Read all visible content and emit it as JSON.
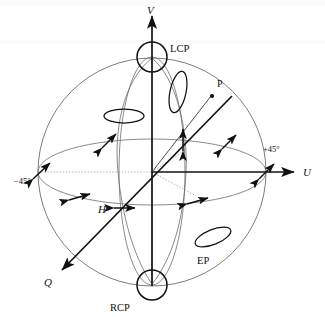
{
  "figure": {
    "name": "poincare-sphere",
    "background_color": "#ffffff",
    "line_color": "#111111",
    "wire_color": "#6b6b6b"
  },
  "axes": [
    {
      "id": "V",
      "label": "V",
      "direction": "up",
      "label_x": 151,
      "label_y": 11
    },
    {
      "id": "U",
      "label": "U",
      "direction": "right",
      "label_x": 305,
      "label_y": 176
    },
    {
      "id": "Q",
      "label": "Q",
      "direction": "down-left",
      "label_x": 47,
      "label_y": 283
    }
  ],
  "poles": {
    "top": {
      "label": "LCP",
      "meaning": "left circular polarization",
      "label_x": 170,
      "label_y": 49,
      "cx": 152,
      "cy": 57,
      "r": 15
    },
    "bottom": {
      "label": "RCP",
      "meaning": "right circular polarization",
      "label_x": 111,
      "label_y": 309,
      "cx": 152,
      "cy": 285,
      "r": 15
    }
  },
  "equator_markers": [
    {
      "label": "H",
      "meaning": "horizontal linear polarization",
      "label_x": 100,
      "label_y": 212,
      "italic": true
    },
    {
      "label": "+45°",
      "meaning": "plus 45 degree linear polarization",
      "label_x": 266,
      "label_y": 150
    },
    {
      "label": "−45°",
      "meaning": "minus 45 degree linear polarization",
      "label_x": 18,
      "label_y": 182
    }
  ],
  "points": [
    {
      "label": "P",
      "meaning": "arbitrary polarization state vector tip",
      "x": 212,
      "y": 95,
      "label_x": 218,
      "label_y": 86
    }
  ],
  "ellipses": [
    {
      "label": "EP",
      "meaning": "elliptical polarization example",
      "cx": 213,
      "cy": 237,
      "rx": 19,
      "ry": 7.5,
      "rotation": -22,
      "label_x": 199,
      "label_y": 262
    },
    {
      "label": "",
      "meaning": "flat ellipse upper left quadrant",
      "cx": 124,
      "cy": 116,
      "rx": 20,
      "ry": 7,
      "rotation": 0,
      "label_x": 0,
      "label_y": 0
    },
    {
      "label": "",
      "meaning": "narrow vertical ellipse upper right quadrant",
      "cx": 178,
      "cy": 92,
      "rx": 8,
      "ry": 21,
      "rotation": 12,
      "label_x": 0,
      "label_y": 0
    }
  ],
  "linear_state_arrows": [
    {
      "meaning": "plus-45-degree linear state, upper left",
      "cx": 109,
      "cy": 141,
      "angle": -45,
      "length": 20
    },
    {
      "meaning": "vertical linear state, upper middle",
      "cx": 183,
      "cy": 140,
      "angle": -90,
      "length": 21
    },
    {
      "meaning": "plus-45-degree linear state, upper right",
      "cx": 229,
      "cy": 142,
      "angle": -45,
      "length": 20
    },
    {
      "meaning": "plus-45-degree linear state at U axis right edge",
      "cx": 266,
      "cy": 172,
      "angle": -45,
      "length": 20
    },
    {
      "meaning": "minus-45-degree linear state at U axis left edge",
      "cx": 41,
      "cy": 171,
      "angle": 45,
      "length": 21
    },
    {
      "meaning": "near-horizontal linear state, lower left",
      "cx": 79,
      "cy": 197,
      "angle": 16,
      "length": 21
    },
    {
      "meaning": "horizontal linear state at H point",
      "cx": 124,
      "cy": 208,
      "angle": 0,
      "length": 21
    },
    {
      "meaning": "near-horizontal linear state, lower right",
      "cx": 197,
      "cy": 201,
      "angle": -13,
      "length": 21
    }
  ],
  "geometry": {
    "center_x": 152,
    "center_y": 172,
    "radius": 114,
    "equator_ry": 33,
    "meridian_rx": 33
  }
}
